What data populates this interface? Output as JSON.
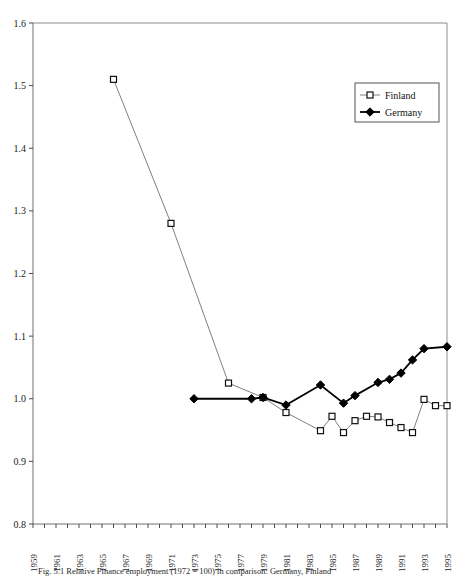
{
  "chart_data": {
    "type": "line",
    "title": "",
    "xlabel": "",
    "ylabel": "",
    "xlim": [
      1959,
      1995
    ],
    "ylim": [
      0.8,
      1.6
    ],
    "ytick_labels": [
      "1.6",
      "1.5",
      "1.4",
      "1.3",
      "1.2",
      "1.1",
      "1.0",
      "0.9",
      "0.8"
    ],
    "ytick_values": [
      1.6,
      1.5,
      1.4,
      1.3,
      1.2,
      1.1,
      1.0,
      0.9,
      0.8
    ],
    "xtick_labels": [
      "1959",
      "1961",
      "1963",
      "1965",
      "1967",
      "1969",
      "1971",
      "1973",
      "1975",
      "1977",
      "1979",
      "1981",
      "1983",
      "1985",
      "1987",
      "1989",
      "1991",
      "1993",
      "1995"
    ],
    "xtick_values": [
      1959,
      1961,
      1963,
      1965,
      1967,
      1969,
      1971,
      1973,
      1975,
      1977,
      1979,
      1981,
      1983,
      1985,
      1987,
      1989,
      1991,
      1993,
      1995
    ],
    "grid": false,
    "legend_position": "top-right",
    "series": [
      {
        "name": "Finland",
        "marker": "open-square",
        "color": "#808080",
        "marker_fill": "#ffffff",
        "marker_stroke": "#111111",
        "x": [
          1966,
          1971,
          1976,
          1979,
          1981,
          1984,
          1985,
          1986,
          1987,
          1988,
          1989,
          1990,
          1991,
          1992,
          1993,
          1994,
          1995
        ],
        "y": [
          1.51,
          1.28,
          1.025,
          1.002,
          0.978,
          0.949,
          0.972,
          0.946,
          0.965,
          0.972,
          0.971,
          0.962,
          0.954,
          0.946,
          0.999,
          0.989,
          0.989
        ]
      },
      {
        "name": "Germany",
        "marker": "filled-diamond",
        "color": "#000000",
        "marker_fill": "#000000",
        "marker_stroke": "#000000",
        "x": [
          1973,
          1978,
          1979,
          1981,
          1984,
          1986,
          1987,
          1989,
          1990,
          1991,
          1992,
          1993,
          1995
        ],
        "y": [
          1.0,
          1.0,
          1.002,
          0.99,
          1.022,
          0.993,
          1.005,
          1.026,
          1.031,
          1.041,
          1.062,
          1.08,
          1.083
        ]
      }
    ]
  },
  "legend": {
    "entries": [
      {
        "label": "Finland"
      },
      {
        "label": "Germany"
      }
    ]
  },
  "caption": {
    "text": "Fig. 5.1 Relative Finance employment (1972 = 100) in comparison: Germany, Finland"
  }
}
